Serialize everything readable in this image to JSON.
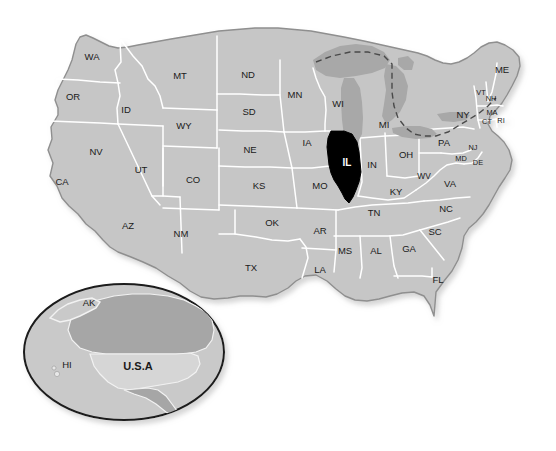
{
  "map": {
    "title": "United States map with Illinois highlighted",
    "colors": {
      "background": "#ffffff",
      "state_fill": "#c6c6c6",
      "state_border": "#ffffff",
      "country_outline": "#8f8f8f",
      "highlight_fill": "#000000",
      "highlight_text": "#ffffff",
      "lake_fill": "#a8a8a8",
      "label_text": "#1a1a1a",
      "inset_ocean": "#c9c9c9",
      "inset_canada": "#a6a6a6",
      "inset_usa": "#d6d6d6",
      "inset_border": "#1a1a1a"
    },
    "highlighted_state": "IL",
    "states": [
      {
        "code": "WA",
        "name": "Washington",
        "x": 92,
        "y": 57,
        "size": "normal"
      },
      {
        "code": "OR",
        "name": "Oregon",
        "x": 73,
        "y": 97,
        "size": "normal"
      },
      {
        "code": "CA",
        "name": "California",
        "x": 62,
        "y": 182,
        "size": "normal"
      },
      {
        "code": "ID",
        "name": "Idaho",
        "x": 126,
        "y": 110,
        "size": "normal"
      },
      {
        "code": "NV",
        "name": "Nevada",
        "x": 96,
        "y": 152,
        "size": "normal"
      },
      {
        "code": "MT",
        "name": "Montana",
        "x": 180,
        "y": 76,
        "size": "normal"
      },
      {
        "code": "WY",
        "name": "Wyoming",
        "x": 184,
        "y": 126,
        "size": "normal"
      },
      {
        "code": "UT",
        "name": "Utah",
        "x": 141,
        "y": 170,
        "size": "normal"
      },
      {
        "code": "CO",
        "name": "Colorado",
        "x": 193,
        "y": 180,
        "size": "normal"
      },
      {
        "code": "AZ",
        "name": "Arizona",
        "x": 128,
        "y": 226,
        "size": "normal"
      },
      {
        "code": "NM",
        "name": "New Mexico",
        "x": 181,
        "y": 234,
        "size": "normal"
      },
      {
        "code": "ND",
        "name": "North Dakota",
        "x": 248,
        "y": 75,
        "size": "normal"
      },
      {
        "code": "SD",
        "name": "South Dakota",
        "x": 249,
        "y": 112,
        "size": "normal"
      },
      {
        "code": "NE",
        "name": "Nebraska",
        "x": 250,
        "y": 150,
        "size": "normal"
      },
      {
        "code": "KS",
        "name": "Kansas",
        "x": 259,
        "y": 186,
        "size": "normal"
      },
      {
        "code": "OK",
        "name": "Oklahoma",
        "x": 272,
        "y": 223,
        "size": "normal"
      },
      {
        "code": "TX",
        "name": "Texas",
        "x": 251,
        "y": 268,
        "size": "normal"
      },
      {
        "code": "MN",
        "name": "Minnesota",
        "x": 295,
        "y": 95,
        "size": "normal"
      },
      {
        "code": "IA",
        "name": "Iowa",
        "x": 307,
        "y": 143,
        "size": "normal"
      },
      {
        "code": "MO",
        "name": "Missouri",
        "x": 320,
        "y": 186,
        "size": "normal"
      },
      {
        "code": "AR",
        "name": "Arkansas",
        "x": 320,
        "y": 231,
        "size": "normal"
      },
      {
        "code": "LA",
        "name": "Louisiana",
        "x": 320,
        "y": 270,
        "size": "normal"
      },
      {
        "code": "WI",
        "name": "Wisconsin",
        "x": 338,
        "y": 104,
        "size": "normal"
      },
      {
        "code": "IL",
        "name": "Illinois",
        "x": 347,
        "y": 163,
        "size": "highlight"
      },
      {
        "code": "MS",
        "name": "Mississippi",
        "x": 345,
        "y": 251,
        "size": "normal"
      },
      {
        "code": "MI",
        "name": "Michigan",
        "x": 384,
        "y": 125,
        "size": "normal"
      },
      {
        "code": "IN",
        "name": "Indiana",
        "x": 372,
        "y": 165,
        "size": "normal"
      },
      {
        "code": "KY",
        "name": "Kentucky",
        "x": 396,
        "y": 192,
        "size": "normal"
      },
      {
        "code": "TN",
        "name": "Tennessee",
        "x": 374,
        "y": 213,
        "size": "normal"
      },
      {
        "code": "AL",
        "name": "Alabama",
        "x": 376,
        "y": 251,
        "size": "normal"
      },
      {
        "code": "GA",
        "name": "Georgia",
        "x": 409,
        "y": 249,
        "size": "normal"
      },
      {
        "code": "FL",
        "name": "Florida",
        "x": 438,
        "y": 280,
        "size": "normal"
      },
      {
        "code": "OH",
        "name": "Ohio",
        "x": 406,
        "y": 155,
        "size": "normal"
      },
      {
        "code": "WV",
        "name": "West Virginia",
        "x": 424,
        "y": 177,
        "size": "small"
      },
      {
        "code": "VA",
        "name": "Virginia",
        "x": 450,
        "y": 184,
        "size": "normal"
      },
      {
        "code": "NC",
        "name": "North Carolina",
        "x": 446,
        "y": 209,
        "size": "normal"
      },
      {
        "code": "SC",
        "name": "South Carolina",
        "x": 435,
        "y": 232,
        "size": "normal"
      },
      {
        "code": "PA",
        "name": "Pennsylvania",
        "x": 444,
        "y": 143,
        "size": "normal"
      },
      {
        "code": "NY",
        "name": "New York",
        "x": 463,
        "y": 115,
        "size": "normal"
      },
      {
        "code": "ME",
        "name": "Maine",
        "x": 502,
        "y": 70,
        "size": "normal"
      },
      {
        "code": "VT",
        "name": "Vermont",
        "x": 481,
        "y": 93,
        "size": "tiny"
      },
      {
        "code": "NH",
        "name": "New Hampshire",
        "x": 491,
        "y": 99,
        "size": "tiny"
      },
      {
        "code": "MA",
        "name": "Massachusetts",
        "x": 492,
        "y": 113,
        "size": "tiny"
      },
      {
        "code": "CT",
        "name": "Connecticut",
        "x": 487,
        "y": 122,
        "size": "tiny"
      },
      {
        "code": "RI",
        "name": "Rhode Island",
        "x": 501,
        "y": 121,
        "size": "tiny"
      },
      {
        "code": "NJ",
        "name": "New Jersey",
        "x": 473,
        "y": 148,
        "size": "tiny"
      },
      {
        "code": "MD",
        "name": "Maryland",
        "x": 461,
        "y": 159,
        "size": "tiny"
      },
      {
        "code": "DE",
        "name": "Delaware",
        "x": 478,
        "y": 163,
        "size": "tiny"
      }
    ],
    "inset": {
      "name": "north-america-locator-globe",
      "labels": [
        {
          "code": "AK",
          "name": "Alaska",
          "x": 89,
          "y": 303,
          "size": "normal"
        },
        {
          "code": "HI",
          "name": "Hawaii",
          "x": 67,
          "y": 365,
          "size": "normal"
        },
        {
          "code": "U.S.A",
          "name": "United States of America",
          "x": 138,
          "y": 367,
          "size": "usa"
        }
      ]
    }
  }
}
